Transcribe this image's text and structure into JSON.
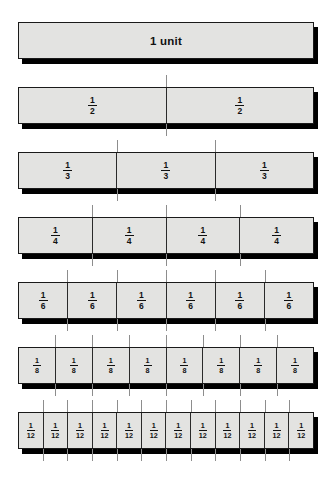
{
  "chart_data": {
    "type": "bar",
    "xlabel": "",
    "ylabel": "",
    "orientation": "horizontal-stacked",
    "grid": false,
    "legend": false,
    "xlim": [
      0,
      1
    ],
    "categories": [
      "1 unit",
      "halves",
      "thirds",
      "fourths",
      "sixths",
      "eighths",
      "twelfths"
    ],
    "values": [
      1,
      2,
      3,
      4,
      6,
      8,
      12
    ],
    "rows": [
      {
        "name": "1 unit",
        "denominator": 1,
        "parts": 1,
        "part_value": 1,
        "labels": [
          "1 unit"
        ],
        "label_style": "text",
        "dividers": 0,
        "divider_positions": []
      },
      {
        "name": "halves",
        "denominator": 2,
        "parts": 2,
        "part_value": 0.5,
        "numerator": "1",
        "labels": [
          "1/2",
          "1/2"
        ],
        "label_style": "fraction",
        "dividers": 1,
        "divider_positions": [
          50
        ]
      },
      {
        "name": "thirds",
        "denominator": 3,
        "parts": 3,
        "part_value": 0.3333,
        "numerator": "1",
        "labels": [
          "1/3",
          "1/3",
          "1/3"
        ],
        "label_style": "fraction",
        "dividers": 2,
        "divider_positions": [
          33.333,
          66.667
        ]
      },
      {
        "name": "fourths",
        "denominator": 4,
        "parts": 4,
        "part_value": 0.25,
        "numerator": "1",
        "labels": [
          "1/4",
          "1/4",
          "1/4",
          "1/4"
        ],
        "label_style": "fraction",
        "dividers": 3,
        "divider_positions": [
          25,
          50,
          75
        ]
      },
      {
        "name": "sixths",
        "denominator": 6,
        "parts": 6,
        "part_value": 0.1667,
        "numerator": "1",
        "labels": [
          "1/6",
          "1/6",
          "1/6",
          "1/6",
          "1/6",
          "1/6"
        ],
        "label_style": "fraction",
        "dividers": 5,
        "divider_positions": [
          16.667,
          33.333,
          50,
          66.667,
          83.333
        ]
      },
      {
        "name": "eighths",
        "denominator": 8,
        "parts": 8,
        "part_value": 0.125,
        "numerator": "1",
        "labels": [
          "1/8",
          "1/8",
          "1/8",
          "1/8",
          "1/8",
          "1/8",
          "1/8",
          "1/8"
        ],
        "label_style": "fraction",
        "dividers": 7,
        "divider_positions": [
          12.5,
          25,
          37.5,
          50,
          62.5,
          75,
          87.5
        ]
      },
      {
        "name": "twelfths",
        "denominator": 12,
        "parts": 12,
        "part_value": 0.0833,
        "numerator": "1",
        "labels": [
          "1/12",
          "1/12",
          "1/12",
          "1/12",
          "1/12",
          "1/12",
          "1/12",
          "1/12",
          "1/12",
          "1/12",
          "1/12",
          "1/12"
        ],
        "label_style": "fraction",
        "dividers": 11,
        "divider_positions": [
          8.333,
          16.667,
          25,
          33.333,
          41.667,
          50,
          58.333,
          66.667,
          75,
          83.333,
          91.667
        ]
      }
    ]
  },
  "colors": {
    "background": "#ffffff",
    "bar_fill": "#e3e3e1",
    "bar_border": "#1a1a1a",
    "shadow": "#000000",
    "tick_line": "#8d8d8d",
    "text": "#111111"
  },
  "unit_bar": {
    "text": "1 unit"
  },
  "fractions": {
    "half": {
      "num": "1",
      "den": "2"
    },
    "third": {
      "num": "1",
      "den": "3"
    },
    "fourth": {
      "num": "1",
      "den": "4"
    },
    "sixth": {
      "num": "1",
      "den": "6"
    },
    "eighth": {
      "num": "1",
      "den": "8"
    },
    "twelfth": {
      "num": "1",
      "den": "12"
    }
  }
}
